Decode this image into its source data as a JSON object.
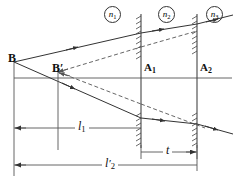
{
  "figure": {
    "type": "optics-ray-diagram",
    "title": "",
    "background_color": "#ffffff",
    "line_color": "#333333",
    "width": 236,
    "height": 181
  },
  "points": {
    "object_label": "B",
    "image_label": "B′",
    "surface1_label": "A",
    "surface1_sub": "1",
    "surface2_label": "A",
    "surface2_sub": "2"
  },
  "indices": [
    {
      "name": "index-n1",
      "symbol": "n",
      "sub": "1"
    },
    {
      "name": "index-n2",
      "symbol": "n",
      "sub": "2"
    },
    {
      "name": "index-n3",
      "symbol": "n",
      "sub": "3"
    }
  ],
  "dimensions": [
    {
      "name": "dim-l1",
      "symbol": "l",
      "sub": "1",
      "prime": ""
    },
    {
      "name": "dim-l2-prime",
      "symbol": "l",
      "sub": "2",
      "prime": "′"
    },
    {
      "name": "dim-t",
      "symbol": "t",
      "sub": "",
      "prime": ""
    }
  ],
  "geometry": {
    "axis_y": 78,
    "object_x": 14,
    "object_y": 62,
    "image_x": 58,
    "image_y": 72,
    "surface1_x": 141,
    "surface2_x": 197,
    "dim_l1_y": 128,
    "dim_l2_y": 165,
    "dim_t_y": 152
  }
}
